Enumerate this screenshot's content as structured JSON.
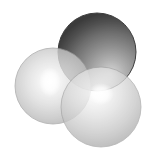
{
  "figure": {
    "kind": "space-filling-sphere-render",
    "width": 159,
    "height": 163,
    "background_color": "#ffffff",
    "color_mode": "grayscale",
    "light_direction": "upper-left-to-center",
    "transparency_note": "spheres are semi-transparent; overlap regions blend"
  },
  "spheres": [
    {
      "id": "sphere-dark-top-right",
      "label": "dark sphere",
      "cx": 97,
      "cy": 52,
      "r": 39,
      "draw_order": 1,
      "opacity": 0.86,
      "shading": {
        "highlight_color": "#c9c9c9",
        "mid_color": "#808080",
        "edge_color": "#2a2a2a",
        "rim_color": "#1a1a1a",
        "highlight_fx": "68%",
        "highlight_fy": "78%"
      },
      "outline_color": "#1e1e1e",
      "outline_width": 1.0
    },
    {
      "id": "sphere-light-left",
      "label": "light sphere left",
      "cx": 53,
      "cy": 86,
      "r": 38,
      "draw_order": 2,
      "opacity": 0.8,
      "shading": {
        "highlight_color": "#ffffff",
        "mid_color": "#d8d8d8",
        "edge_color": "#a8a8a8",
        "rim_color": "#909090",
        "highlight_fx": "46%",
        "highlight_fy": "44%"
      },
      "outline_color": "#9a9a9a",
      "outline_width": 0.8
    },
    {
      "id": "sphere-light-bottom-right",
      "label": "light sphere bottom right",
      "cx": 101,
      "cy": 107,
      "r": 40,
      "draw_order": 3,
      "opacity": 0.78,
      "shading": {
        "highlight_color": "#ffffff",
        "mid_color": "#dcdcdc",
        "edge_color": "#aeaeae",
        "rim_color": "#979797",
        "highlight_fx": "44%",
        "highlight_fy": "32%"
      },
      "outline_color": "#a0a0a0",
      "outline_width": 0.8
    }
  ],
  "highlights": [
    {
      "id": "specular-left",
      "cx": 50,
      "cy": 82,
      "rx": 11,
      "ry": 15,
      "color": "#ffffff"
    },
    {
      "id": "specular-bottom-right",
      "cx": 101,
      "cy": 94,
      "rx": 13,
      "ry": 11,
      "color": "#ffffff"
    }
  ]
}
